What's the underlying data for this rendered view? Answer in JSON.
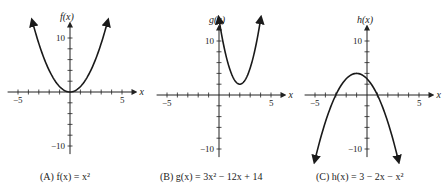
{
  "chart_data": [
    {
      "type": "line",
      "panel": "A",
      "caption": "(A) f(x) = x²",
      "function": "f(x) = x^2",
      "ylabel": "f(x)",
      "xlabel": "x",
      "xlim": [
        -6,
        6
      ],
      "ylim": [
        -12,
        12
      ],
      "x_ticks_labeled": [
        -5,
        5
      ],
      "y_ticks_labeled": [
        10,
        -10
      ],
      "grid": false,
      "coef": [
        1,
        0,
        0
      ],
      "domain": [
        -3.6,
        3.6
      ],
      "arrows": "both ends"
    },
    {
      "type": "line",
      "panel": "B",
      "caption": "(B) g(x) = 3x² − 12x + 14",
      "function": "g(x) = 3x^2 - 12x + 14",
      "ylabel": "g(x)",
      "xlabel": "x",
      "xlim": [
        -6,
        6
      ],
      "ylim": [
        -12,
        12
      ],
      "x_ticks_labeled": [
        -5,
        5
      ],
      "y_ticks_labeled": [
        10,
        -10
      ],
      "grid": false,
      "coef": [
        3,
        -12,
        14
      ],
      "domain": [
        0.0,
        4.0
      ],
      "vertex": [
        2,
        2
      ],
      "arrows": "both ends"
    },
    {
      "type": "line",
      "panel": "C",
      "caption": "(C) h(x) = 3 − 2x − x²",
      "function": "h(x) = 3 - 2x - x^2",
      "ylabel": "h(x)",
      "xlabel": "x",
      "xlim": [
        -6,
        6
      ],
      "ylim": [
        -12,
        12
      ],
      "x_ticks_labeled": [
        -5,
        5
      ],
      "y_ticks_labeled": [
        10,
        -10
      ],
      "grid": false,
      "coef": [
        -1,
        -2,
        3
      ],
      "domain": [
        -5.0,
        3.0
      ],
      "vertex": [
        -1,
        4
      ],
      "arrows": "both ends"
    }
  ],
  "panels": [
    {
      "id": "A",
      "ylabel": "f(x)",
      "xlabel": "x",
      "tick_neg5": "−5",
      "tick_5": "5",
      "tick_10": "10",
      "tick_neg10": "−10",
      "caption_prefix": "(A)",
      "caption_expr": "f(x) = x²"
    },
    {
      "id": "B",
      "ylabel": "g(x)",
      "xlabel": "x",
      "tick_neg5": "−5",
      "tick_5": "5",
      "tick_10": "10",
      "tick_neg10": "−10",
      "caption_prefix": "(B)",
      "caption_expr": "g(x) = 3x² − 12x + 14"
    },
    {
      "id": "C",
      "ylabel": "h(x)",
      "xlabel": "x",
      "tick_neg5": "−5",
      "tick_5": "5",
      "tick_10": "10",
      "tick_neg10": "−10",
      "caption_prefix": "(C)",
      "caption_expr": "h(x) = 3 − 2x − x²"
    }
  ],
  "colors": {
    "ink": "#222222",
    "curve": "#1a1a1a"
  }
}
